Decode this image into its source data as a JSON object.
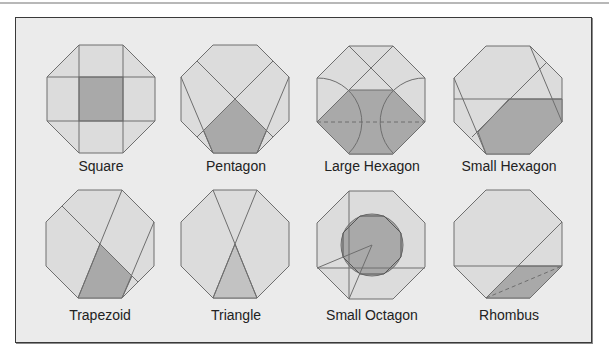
{
  "colors": {
    "panel_bg": "#ebebeb",
    "octagon_fill": "#dcdcdc",
    "shape_dark": "#a9a9a9",
    "shape_medium": "#c2c2c2",
    "stroke": "#6e6e6e",
    "border": "#3a3a3a"
  },
  "figures": [
    {
      "label": "Square",
      "x": 47,
      "y": 45,
      "cx": 101,
      "ly": 158
    },
    {
      "label": "Pentagon",
      "x": 181,
      "y": 45,
      "cx": 236,
      "ly": 158
    },
    {
      "label": "Large Hexagon",
      "x": 317,
      "y": 46,
      "cx": 372,
      "ly": 158
    },
    {
      "label": "Small Hexagon",
      "x": 454,
      "y": 46,
      "cx": 509,
      "ly": 158
    },
    {
      "label": "Trapezoid",
      "x": 46,
      "y": 190,
      "cx": 100,
      "ly": 307
    },
    {
      "label": "Triangle",
      "x": 181,
      "y": 190,
      "cx": 236,
      "ly": 307
    },
    {
      "label": "Small Octagon",
      "x": 317,
      "y": 191,
      "cx": 372,
      "ly": 307
    },
    {
      "label": "Rhombus",
      "x": 454,
      "y": 190,
      "cx": 509,
      "ly": 307
    }
  ]
}
